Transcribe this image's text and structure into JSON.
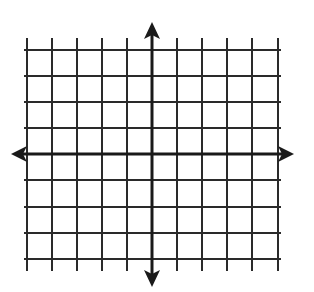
{
  "diagram": {
    "type": "coordinate-plane",
    "colors": {
      "grid": "#2a2a2a",
      "axis": "#1a1a1a",
      "background": "#ffffff"
    },
    "grid": {
      "vertical_lines_x": [
        27,
        52,
        77,
        102,
        127,
        152,
        177,
        202,
        227,
        252,
        278
      ],
      "horizontal_lines_y": [
        50,
        76,
        102,
        128,
        154,
        180,
        207,
        233,
        259
      ],
      "vertical_extent": [
        38,
        271
      ],
      "horizontal_extent": [
        22,
        282
      ]
    },
    "axes": {
      "x_axis": {
        "y": 154,
        "from": 11,
        "to": 294
      },
      "y_axis": {
        "x": 152,
        "from": 22,
        "to": 287
      }
    },
    "labels": []
  }
}
